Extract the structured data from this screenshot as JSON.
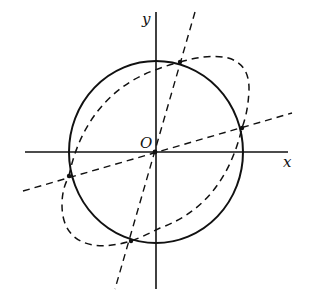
{
  "diagram": {
    "labels": {
      "x_axis": "x",
      "y_axis": "y",
      "origin": "O"
    },
    "colors": {
      "ink": "#111111",
      "background": "#ffffff"
    },
    "elements": [
      {
        "name": "x-axis",
        "type": "axis",
        "style": "solid"
      },
      {
        "name": "y-axis",
        "type": "axis",
        "style": "solid"
      },
      {
        "name": "circle",
        "type": "circle",
        "style": "solid",
        "center": "O"
      },
      {
        "name": "rotated-closed-curve",
        "type": "curve",
        "style": "dashed"
      },
      {
        "name": "steep-line",
        "type": "line",
        "style": "dashed",
        "through": "O"
      },
      {
        "name": "shallow-line",
        "type": "line",
        "style": "dashed",
        "through": "O"
      }
    ],
    "intersection_points": 4
  }
}
